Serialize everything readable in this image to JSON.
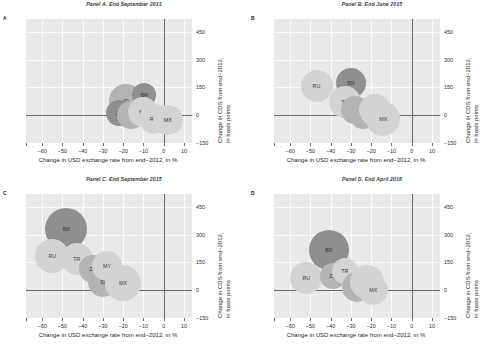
{
  "figure": {
    "xlabel": "Change in USD exchange rate from end−2012, in %",
    "ylabel_line1": "Change in CDS from end−2012,",
    "ylabel_line2": "in basis points",
    "xticks": [
      "−60",
      "−50",
      "−40",
      "−30",
      "−20",
      "−10",
      "0",
      "10"
    ],
    "yticks": [
      "450",
      "300",
      "150",
      "0",
      "−150"
    ],
    "colors": {
      "plot_background": "#e9e9e9",
      "gridline": "#fbfbfb",
      "axis": "#6b6b6b",
      "bubble_light": "#d3d3d3",
      "bubble_mid": "#b4b4b4",
      "bubble_dark": "#8f8f8f",
      "label_text": "#3b3b3b"
    }
  },
  "chart_data": [
    {
      "type": "scatter",
      "panel": "A",
      "title": "Panel A. End September 2013",
      "xlabel": "Change in USD exchange rate from end−2012, in %",
      "ylabel": "Change in CDS from end−2012, in basis points",
      "xlim": [
        -68,
        14
      ],
      "ylim": [
        -150,
        520
      ],
      "xticks": [
        -60,
        -50,
        -40,
        -30,
        -20,
        -10,
        0,
        10
      ],
      "yticks": [
        450,
        300,
        150,
        0,
        -150
      ],
      "grid": true,
      "legend": "none",
      "bubbles": [
        {
          "label": "ID",
          "x": -18.5,
          "y": 75,
          "size": 34,
          "shade": "bubble_mid"
        },
        {
          "label": "BR",
          "x": -9.5,
          "y": 112,
          "size": 24,
          "shade": "bubble_dark"
        },
        {
          "label": "ZA",
          "x": -22.0,
          "y": 14,
          "size": 26,
          "shade": "bubble_dark"
        },
        {
          "label": "TR",
          "x": -16.0,
          "y": 2,
          "size": 28,
          "shade": "bubble_mid"
        },
        {
          "label": "MY",
          "x": -10.0,
          "y": 20,
          "size": 30,
          "shade": "bubble_light"
        },
        {
          "label": "RU",
          "x": -5.0,
          "y": -20,
          "size": 30,
          "shade": "bubble_light"
        },
        {
          "label": "MX",
          "x": 2.0,
          "y": -25,
          "size": 30,
          "shade": "bubble_light"
        }
      ]
    },
    {
      "type": "scatter",
      "panel": "B",
      "title": "Panel B. End June 2015",
      "xlabel": "Change in USD exchange rate from end−2012, in %",
      "ylabel": "Change in CDS from end−2012, in basis points",
      "xlim": [
        -68,
        14
      ],
      "ylim": [
        -150,
        520
      ],
      "xticks": [
        -60,
        -50,
        -40,
        -30,
        -20,
        -10,
        0,
        10
      ],
      "yticks": [
        450,
        300,
        150,
        0,
        -150
      ],
      "grid": true,
      "legend": "none",
      "bubbles": [
        {
          "label": "RU",
          "x": -47.0,
          "y": 160,
          "size": 32,
          "shade": "bubble_light"
        },
        {
          "label": "BR",
          "x": -30.0,
          "y": 175,
          "size": 30,
          "shade": "bubble_dark"
        },
        {
          "label": "TR",
          "x": -33.0,
          "y": 70,
          "size": 32,
          "shade": "bubble_light"
        },
        {
          "label": "ZA",
          "x": -28.0,
          "y": 30,
          "size": 28,
          "shade": "bubble_mid"
        },
        {
          "label": "ID",
          "x": -24.0,
          "y": -5,
          "size": 26,
          "shade": "bubble_mid"
        },
        {
          "label": "MY",
          "x": -18.0,
          "y": 30,
          "size": 32,
          "shade": "bubble_light"
        },
        {
          "label": "MX",
          "x": -14.0,
          "y": -20,
          "size": 34,
          "shade": "bubble_light"
        }
      ]
    },
    {
      "type": "scatter",
      "panel": "C",
      "title": "Panel C. End September 2015",
      "xlabel": "Change in USD exchange rate from end−2012, in %",
      "ylabel": "Change in CDS from end−2012, in basis points",
      "xlim": [
        -68,
        14
      ],
      "ylim": [
        -150,
        520
      ],
      "xticks": [
        -60,
        -50,
        -40,
        -30,
        -20,
        -10,
        0,
        10
      ],
      "yticks": [
        450,
        300,
        150,
        0,
        -150
      ],
      "grid": true,
      "legend": "none",
      "bubbles": [
        {
          "label": "BR",
          "x": -48.0,
          "y": 330,
          "size": 42,
          "shade": "bubble_dark"
        },
        {
          "label": "RU",
          "x": -55.0,
          "y": 185,
          "size": 34,
          "shade": "bubble_light"
        },
        {
          "label": "TR",
          "x": -43.0,
          "y": 170,
          "size": 32,
          "shade": "bubble_light"
        },
        {
          "label": "ZA",
          "x": -35.0,
          "y": 115,
          "size": 28,
          "shade": "bubble_mid"
        },
        {
          "label": "ID",
          "x": -30.0,
          "y": 45,
          "size": 30,
          "shade": "bubble_mid"
        },
        {
          "label": "MY",
          "x": -28.0,
          "y": 130,
          "size": 30,
          "shade": "bubble_light"
        },
        {
          "label": "MX",
          "x": -20.0,
          "y": 40,
          "size": 36,
          "shade": "bubble_light"
        }
      ]
    },
    {
      "type": "scatter",
      "panel": "D",
      "title": "Panel D. End April 2016",
      "xlabel": "Change in USD exchange rate from end−2012, in %",
      "ylabel": "Change in CDS from end−2012, in basis points",
      "xlim": [
        -68,
        14
      ],
      "ylim": [
        -150,
        520
      ],
      "xticks": [
        -60,
        -50,
        -40,
        -30,
        -20,
        -10,
        0,
        10
      ],
      "yticks": [
        450,
        300,
        150,
        0,
        -150
      ],
      "grid": true,
      "legend": "none",
      "bubbles": [
        {
          "label": "BR",
          "x": -41.0,
          "y": 215,
          "size": 40,
          "shade": "bubble_dark"
        },
        {
          "label": "RU",
          "x": -52.0,
          "y": 65,
          "size": 32,
          "shade": "bubble_light"
        },
        {
          "label": "ZA",
          "x": -39.0,
          "y": 75,
          "size": 26,
          "shade": "bubble_mid"
        },
        {
          "label": "TR",
          "x": -33.0,
          "y": 105,
          "size": 26,
          "shade": "bubble_light"
        },
        {
          "label": "ID",
          "x": -27.0,
          "y": 15,
          "size": 30,
          "shade": "bubble_mid"
        },
        {
          "label": "MY",
          "x": -22.0,
          "y": 45,
          "size": 34,
          "shade": "bubble_light"
        },
        {
          "label": "MX",
          "x": -19.0,
          "y": 0,
          "size": 30,
          "shade": "bubble_light"
        }
      ]
    }
  ]
}
